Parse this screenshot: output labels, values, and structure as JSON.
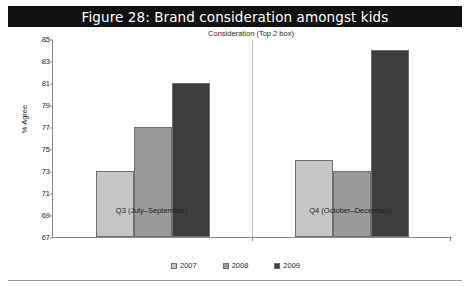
{
  "figure": {
    "title": "Figure 28: Brand consideration amongst kids",
    "title_bg": "#111111",
    "title_color": "#ffffff"
  },
  "chart_data": {
    "type": "bar",
    "title": "Figure 28: Brand consideration amongst kids",
    "subtitle": "Consideration (Top 2 box)",
    "xlabel": "",
    "ylabel": "% Agree",
    "categories": [
      "Q3 (July–September)",
      "Q4 (October–December)"
    ],
    "series": [
      {
        "name": "2007",
        "values": [
          73,
          74
        ],
        "color": "#c6c6c6"
      },
      {
        "name": "2008",
        "values": [
          77,
          73
        ],
        "color": "#9a9a9a"
      },
      {
        "name": "2009",
        "values": [
          81,
          84
        ],
        "color": "#3d3d3d"
      }
    ],
    "ylim": [
      67,
      85
    ],
    "yticks": [
      67,
      69,
      71,
      73,
      75,
      77,
      79,
      81,
      83,
      85
    ],
    "ytick_labels": [
      "67",
      "69",
      "71",
      "73",
      "75",
      "77",
      "79",
      "81",
      "83",
      "85"
    ],
    "grid": false,
    "legend_position": "bottom"
  }
}
